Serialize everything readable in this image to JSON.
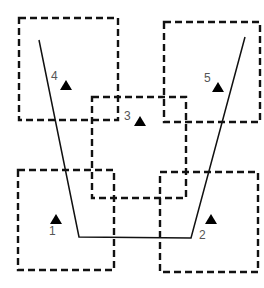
{
  "diagram": {
    "colors": {
      "stroke": "#111111",
      "label": "#555555",
      "marker": "#000000",
      "background": "#ffffff"
    },
    "zones": [
      {
        "id": "4",
        "x": 19,
        "y": 18,
        "w": 99,
        "h": 102
      },
      {
        "id": "5",
        "x": 164,
        "y": 22,
        "w": 96,
        "h": 100
      },
      {
        "id": "3",
        "x": 92,
        "y": 97,
        "w": 94,
        "h": 101
      },
      {
        "id": "1",
        "x": 18,
        "y": 170,
        "w": 96,
        "h": 100
      },
      {
        "id": "2",
        "x": 160,
        "y": 172,
        "w": 98,
        "h": 100
      }
    ],
    "route": {
      "points": "39,40 79,237 191,238 245,37"
    },
    "points": [
      {
        "label": "1",
        "tri_x": 56,
        "tri_y": 219,
        "text_x": 49,
        "text_y": 235
      },
      {
        "label": "2",
        "tri_x": 211,
        "tri_y": 219,
        "text_x": 199,
        "text_y": 239
      },
      {
        "label": "3",
        "tri_x": 140,
        "tri_y": 121,
        "text_x": 124,
        "text_y": 120
      },
      {
        "label": "4",
        "tri_x": 66,
        "tri_y": 85,
        "text_x": 51,
        "text_y": 80
      },
      {
        "label": "5",
        "tri_x": 218,
        "tri_y": 87,
        "text_x": 204,
        "text_y": 82
      }
    ]
  }
}
